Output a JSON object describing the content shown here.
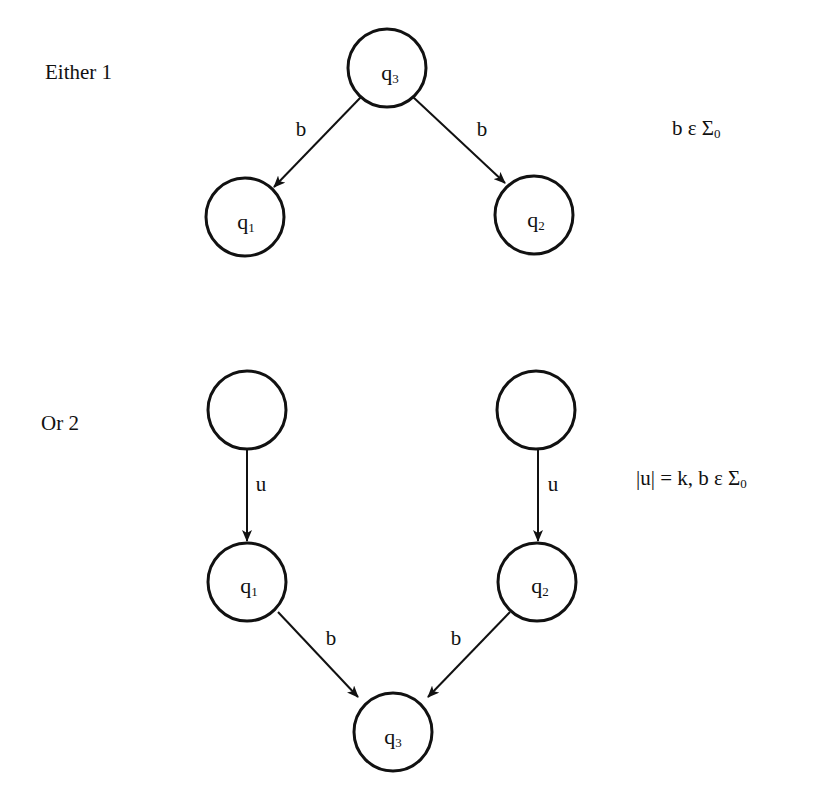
{
  "diagram": {
    "type": "state-transition-diagram",
    "cases": [
      {
        "label": "Either 1",
        "condition": {
          "text": "b ε Σ",
          "subscript": "0"
        },
        "nodes": [
          {
            "id": "q3",
            "name": "q",
            "sub": "3",
            "cx": 387,
            "cy": 68
          },
          {
            "id": "q1",
            "name": "q",
            "sub": "1",
            "cx": 245,
            "cy": 217
          },
          {
            "id": "q2",
            "name": "q",
            "sub": "2",
            "cx": 534,
            "cy": 215
          }
        ],
        "edges": [
          {
            "from": "q3",
            "to": "q1",
            "label": "b"
          },
          {
            "from": "q3",
            "to": "q2",
            "label": "b"
          }
        ]
      },
      {
        "label": "Or 2",
        "condition": {
          "text": "|u| = k, b ε Σ",
          "subscript": "0"
        },
        "nodes": [
          {
            "id": "blank_left",
            "name": "",
            "sub": "",
            "cx": 247,
            "cy": 410
          },
          {
            "id": "blank_right",
            "name": "",
            "sub": "",
            "cx": 536,
            "cy": 410
          },
          {
            "id": "q1",
            "name": "q",
            "sub": "1",
            "cx": 247,
            "cy": 582
          },
          {
            "id": "q2",
            "name": "q",
            "sub": "2",
            "cx": 537,
            "cy": 582
          },
          {
            "id": "q3",
            "name": "q",
            "sub": "3",
            "cx": 393,
            "cy": 732
          }
        ],
        "edges": [
          {
            "from": "blank_left",
            "to": "q1",
            "label": "u"
          },
          {
            "from": "blank_right",
            "to": "q2",
            "label": "u"
          },
          {
            "from": "q1",
            "to": "q3",
            "label": "b"
          },
          {
            "from": "q2",
            "to": "q3",
            "label": "b"
          }
        ]
      }
    ]
  },
  "labels": {
    "case1": "Either 1",
    "case2": "Or 2",
    "cond1_main": "b ε Σ",
    "cond1_sub": "0",
    "cond2_main": "|u| = k, b ε Σ",
    "cond2_sub": "0",
    "q": "q",
    "s1": "1",
    "s2": "2",
    "s3": "3",
    "edge_b": "b",
    "edge_u": "u"
  },
  "colors": {
    "stroke": "#111111",
    "background": "#ffffff"
  }
}
